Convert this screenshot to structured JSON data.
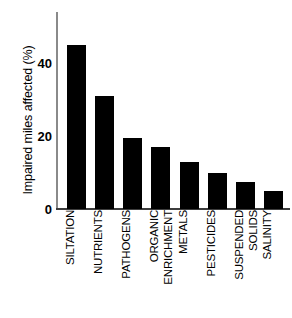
{
  "chart_data": {
    "type": "bar",
    "title": "",
    "xlabel": "",
    "ylabel": "Impaired miles affected (%)",
    "categories": [
      "SILTATION",
      "NUTRIENTS",
      "PATHOGENS",
      "ORGANIC ENRICHMENT",
      "METALS",
      "PESTICIDES",
      "SUSPENDED SOLIDS",
      "SALINITY"
    ],
    "category_lines": [
      [
        "SILTATION"
      ],
      [
        "NUTRIENTS"
      ],
      [
        "PATHOGENS"
      ],
      [
        "ORGANIC",
        "ENRICHMENT"
      ],
      [
        "METALS"
      ],
      [
        "PESTICIDES"
      ],
      [
        "SUSPENDED",
        "SOLIDS"
      ],
      [
        "SALINITY"
      ]
    ],
    "values": [
      45,
      31,
      19.5,
      17,
      13,
      10,
      7.5,
      5
    ],
    "ylim": [
      0,
      54
    ],
    "yticks": [
      0,
      20,
      40
    ],
    "ytick_labels": [
      "0",
      "20",
      "40"
    ],
    "grid": false,
    "legend": null,
    "bar_color": "#000000",
    "axis_color": "#3d3d3d",
    "background": "#ffffff"
  }
}
